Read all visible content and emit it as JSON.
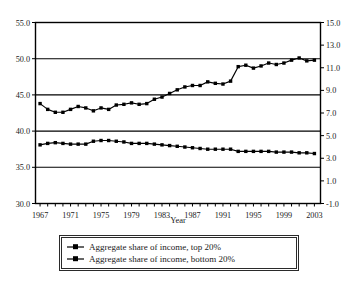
{
  "chart_data": {
    "type": "line",
    "title": "",
    "xlabel": "Year",
    "ylabel": "",
    "xlim": [
      1966.4,
      2003.8
    ],
    "ylim": [
      30.0,
      55.0
    ],
    "y2lim": [
      -1.0,
      15.0
    ],
    "grid": true,
    "legend_position": "bottom-center",
    "x": [
      1967,
      1968,
      1969,
      1970,
      1971,
      1972,
      1973,
      1974,
      1975,
      1976,
      1977,
      1978,
      1979,
      1980,
      1981,
      1982,
      1983,
      1984,
      1985,
      1986,
      1987,
      1988,
      1989,
      1990,
      1991,
      1992,
      1993,
      1994,
      1995,
      1996,
      1997,
      1998,
      1999,
      2000,
      2001,
      2002,
      2003
    ],
    "xticks": [
      1967,
      1971,
      1975,
      1979,
      1983,
      1987,
      1991,
      1995,
      1999,
      2003
    ],
    "yticks": [
      30.0,
      35.0,
      40.0,
      45.0,
      50.0,
      55.0
    ],
    "ytick_labels": [
      "30.0",
      "35.0",
      "40.0",
      "45.0",
      "50.0",
      "55.0"
    ],
    "y2ticks": [
      -1.0,
      1.0,
      3.0,
      5.0,
      7.0,
      9.0,
      11.0,
      13.0,
      15.0
    ],
    "y2tick_labels": [
      "-1.0",
      "1.0",
      "3.0",
      "5.0",
      "7.0",
      "9.0",
      "11.0",
      "13.0",
      "15.0"
    ],
    "series": [
      {
        "name": "Aggregate share of income, top 20%",
        "axis": "left",
        "marker": "square",
        "values": [
          43.8,
          43.0,
          42.6,
          42.6,
          43.0,
          43.4,
          43.2,
          42.8,
          43.2,
          43.0,
          43.6,
          43.7,
          43.9,
          43.7,
          43.8,
          44.4,
          44.7,
          45.2,
          45.7,
          46.1,
          46.3,
          46.3,
          46.8,
          46.6,
          46.5,
          46.9,
          48.9,
          49.1,
          48.7,
          49.0,
          49.4,
          49.2,
          49.4,
          49.8,
          50.1,
          49.7,
          49.8
        ]
      },
      {
        "name": "Aggregate share of income, bottom 20%",
        "axis": "left",
        "marker": "square",
        "values": [
          38.1,
          38.3,
          38.4,
          38.3,
          38.2,
          38.2,
          38.2,
          38.6,
          38.7,
          38.7,
          38.6,
          38.5,
          38.3,
          38.3,
          38.3,
          38.2,
          38.1,
          38.0,
          37.9,
          37.8,
          37.7,
          37.6,
          37.5,
          37.5,
          37.5,
          37.5,
          37.2,
          37.2,
          37.2,
          37.2,
          37.2,
          37.1,
          37.1,
          37.1,
          37.0,
          37.0,
          36.9
        ]
      }
    ]
  },
  "legend": {
    "items": [
      {
        "label": "Aggregate share of income, top 20%"
      },
      {
        "label": "Aggregate share of income, bottom 20%"
      }
    ]
  },
  "axes": {
    "x_title": "Year"
  }
}
